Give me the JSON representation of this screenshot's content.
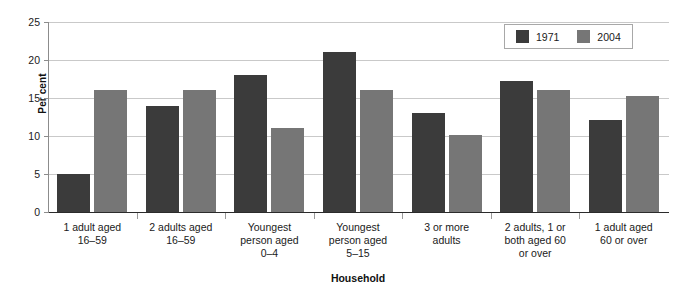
{
  "chart_data": {
    "type": "bar",
    "title": "",
    "subtitle": "",
    "xlabel": "Household",
    "ylabel": "Per cent",
    "ylim": [
      0,
      25
    ],
    "yticks": [
      0,
      5,
      10,
      15,
      20,
      25
    ],
    "ytick_labels": [
      "0",
      "5",
      "10",
      "15",
      "20",
      "25"
    ],
    "grid": "horizontal",
    "legend_position": "top-right",
    "categories": [
      "1 adult aged\n16–59",
      "2 adults aged\n16–59",
      "Youngest\nperson aged\n0–4",
      "Youngest\nperson aged\n5–15",
      "3 or more\nadults",
      "2 adults, 1 or\nboth aged 60\nor over",
      "1 adult aged\n60 or over"
    ],
    "series": [
      {
        "name": "1971",
        "color": "#3b3b3b",
        "values": [
          5,
          14,
          18,
          21,
          13,
          17.2,
          12.1
        ]
      },
      {
        "name": "2004",
        "color": "#767676",
        "values": [
          16,
          16,
          11,
          16,
          10.1,
          16.1,
          15.2
        ]
      }
    ]
  },
  "legend": {
    "entries": [
      {
        "label": "1971"
      },
      {
        "label": "2004"
      }
    ]
  },
  "colors": {
    "series_1971": "#3b3b3b",
    "series_2004": "#767676",
    "gridline": "#c9c9c9",
    "axis": "#2b2b2b",
    "background": "#ffffff"
  }
}
